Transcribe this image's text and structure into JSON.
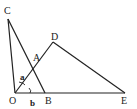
{
  "diagram": {
    "type": "geometry",
    "points": {
      "C": {
        "label": "C",
        "x": 8,
        "y": 19
      },
      "O": {
        "label": "O",
        "x": 15,
        "y": 93
      },
      "B": {
        "label": "B",
        "x": 45,
        "y": 93
      },
      "E": {
        "label": "E",
        "x": 125,
        "y": 93
      },
      "D": {
        "label": "D",
        "x": 53,
        "y": 42
      },
      "A": {
        "label": "A",
        "x": 34,
        "y": 70
      }
    },
    "segments": [
      [
        "O",
        "C"
      ],
      [
        "C",
        "B"
      ],
      [
        "O",
        "E"
      ],
      [
        "O",
        "D"
      ],
      [
        "D",
        "E"
      ]
    ],
    "angles": {
      "a": {
        "label": "a",
        "vertex": "O"
      },
      "b": {
        "label": "b",
        "vertex": "O"
      }
    },
    "line_color": "#222222"
  }
}
